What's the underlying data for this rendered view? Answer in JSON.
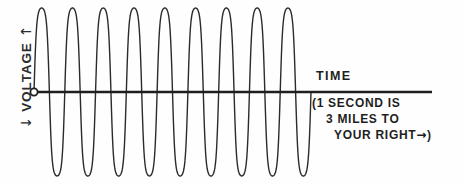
{
  "figure": {
    "background_color": "#fefefe",
    "ink_color": "#1f1f1f"
  },
  "y_axis": {
    "label": "VOLTAGE",
    "arrow_up": "↑",
    "arrow_down": "↓",
    "icon_up": "arrow-up-icon",
    "icon_down": "arrow-down-icon"
  },
  "x_axis": {
    "label": "TIME",
    "origin_marker": "origin-circle"
  },
  "annotation": {
    "line1": "(1 SECOND IS",
    "line2": "3 MILES TO",
    "line3_text": "YOUR RIGHT",
    "line3_arrow": "→",
    "line3_close": ")"
  },
  "chart_data": {
    "type": "line",
    "title": "",
    "xlabel": "TIME",
    "ylabel": "VOLTAGE",
    "subtitle": "(1 SECOND IS 3 MILES TO YOUR RIGHT→)",
    "grid": false,
    "legend": "none",
    "waveform": "sine",
    "cycles": 9,
    "amplitude": 84,
    "baseline_y": 92,
    "peak_y": 10,
    "trough_y": 178,
    "x_start": 34,
    "x_end": 311,
    "axis_x_start": 34,
    "axis_x_end": 432,
    "axis_y": 92,
    "stroke_color": "#2b2b2b",
    "stroke_width": 1.4,
    "samples": 600,
    "xlim": [
      0,
      9
    ],
    "ylim": [
      -1,
      1
    ]
  }
}
